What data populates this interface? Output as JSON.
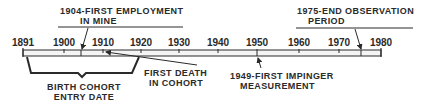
{
  "timeline": {
    "ticks": [
      {
        "label": "1891",
        "x": 23
      },
      {
        "label": "1900",
        "x": 64
      },
      {
        "label": "1910",
        "x": 103
      },
      {
        "label": "1920",
        "x": 141
      },
      {
        "label": "1930",
        "x": 179
      },
      {
        "label": "1940",
        "x": 218
      },
      {
        "label": "1950",
        "x": 257
      },
      {
        "label": "1960",
        "x": 299
      },
      {
        "label": "1970",
        "x": 339
      },
      {
        "label": "1980",
        "x": 381
      }
    ]
  },
  "annotations": {
    "first_employment": {
      "line1": "1904-FIRST EMPLOYMENT",
      "line2": "IN MINE"
    },
    "end_observation": {
      "line1": "1975-END OBSERVATION",
      "line2": "PERIOD"
    },
    "first_death": {
      "line1": "FIRST DEATH",
      "line2": "IN COHORT"
    },
    "first_impinger": {
      "line1": "1949-FIRST IMPINGER",
      "line2": "MEASUREMENT"
    },
    "birth_cohort": {
      "line1": "BIRTH COHORT",
      "line2": "ENTRY DATE"
    }
  },
  "colors": {
    "ink": "#2a2a2a",
    "bar_fill": "#f4f4f4",
    "background": "#ffffff"
  }
}
